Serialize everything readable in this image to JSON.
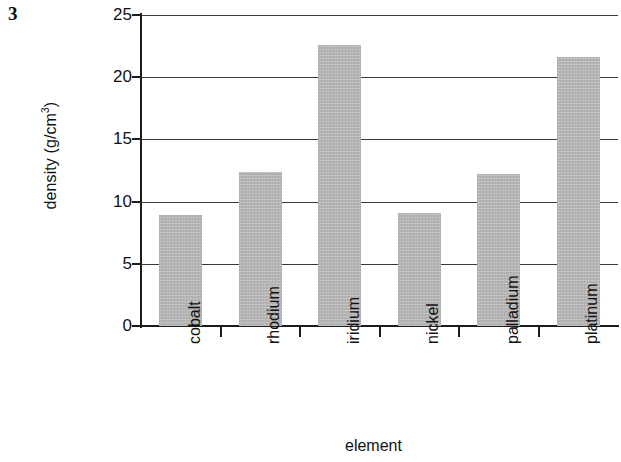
{
  "question_number": "3",
  "chart_data": {
    "type": "bar",
    "title": "",
    "xlabel": "element",
    "ylabel": "density (g/cm3)",
    "ylabel_base": "density (g/cm",
    "ylabel_sup": "3",
    "ylabel_close": ")",
    "categories": [
      "cobalt",
      "rhodium",
      "iridium",
      "nickel",
      "palladium",
      "platinum"
    ],
    "values": [
      8.9,
      12.4,
      22.6,
      9.1,
      12.2,
      21.6
    ],
    "ylim": [
      0,
      25
    ],
    "ytick_labels": [
      "0",
      "5",
      "10",
      "15",
      "20",
      "25"
    ],
    "ytick_values": [
      0,
      5,
      10,
      15,
      20,
      25
    ],
    "grid": true,
    "legend": "none",
    "bar_color": "#b4b4b4",
    "axis_color": "#1c1c1c"
  }
}
